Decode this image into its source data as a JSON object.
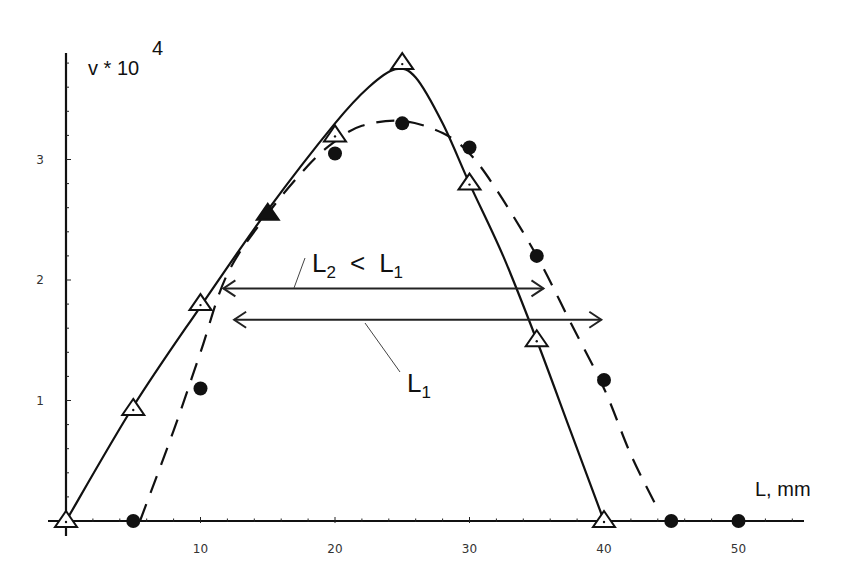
{
  "chart_data": {
    "type": "line",
    "title": "",
    "xlabel": "L, mm",
    "ylabel": "v * 10^4",
    "ylabel_base": "v * 10",
    "ylabel_exp": "4",
    "xlim": [
      0,
      52
    ],
    "ylim": [
      0,
      3.9
    ],
    "x_ticks": [
      10,
      20,
      30,
      40,
      50
    ],
    "y_ticks": [
      1,
      2,
      3
    ],
    "grid": false,
    "legend": null,
    "series": [
      {
        "name": "triangles (solid line)",
        "marker": "open-triangle",
        "line_style": "solid",
        "points": [
          {
            "x": 0,
            "y": 0
          },
          {
            "x": 5,
            "y": 0.93
          },
          {
            "x": 10,
            "y": 1.8
          },
          {
            "x": 15,
            "y": 2.55
          },
          {
            "x": 20,
            "y": 3.2
          },
          {
            "x": 25,
            "y": 3.8
          },
          {
            "x": 30,
            "y": 2.8
          },
          {
            "x": 35,
            "y": 1.5
          },
          {
            "x": 40,
            "y": 0
          }
        ],
        "curve": [
          [
            0,
            0
          ],
          [
            5,
            0.95
          ],
          [
            10,
            1.78
          ],
          [
            15,
            2.58
          ],
          [
            20,
            3.3
          ],
          [
            22.5,
            3.6
          ],
          [
            24.5,
            3.75
          ],
          [
            26,
            3.68
          ],
          [
            28,
            3.3
          ],
          [
            30,
            2.8
          ],
          [
            32.5,
            2.2
          ],
          [
            35,
            1.5
          ],
          [
            37.5,
            0.75
          ],
          [
            40,
            0
          ]
        ]
      },
      {
        "name": "circles (dashed line)",
        "marker": "filled-circle",
        "line_style": "dashed",
        "points": [
          {
            "x": 5,
            "y": 0
          },
          {
            "x": 10,
            "y": 1.1
          },
          {
            "x": 20,
            "y": 3.05
          },
          {
            "x": 25,
            "y": 3.3
          },
          {
            "x": 30,
            "y": 3.1
          },
          {
            "x": 35,
            "y": 2.2
          },
          {
            "x": 40,
            "y": 1.17
          },
          {
            "x": 45,
            "y": 0
          },
          {
            "x": 50,
            "y": 0
          }
        ],
        "curve": [
          [
            5.5,
            0
          ],
          [
            8,
            0.75
          ],
          [
            10,
            1.4
          ],
          [
            12,
            2.05
          ],
          [
            15,
            2.55
          ],
          [
            18,
            2.95
          ],
          [
            20,
            3.15
          ],
          [
            22,
            3.28
          ],
          [
            25,
            3.32
          ],
          [
            28,
            3.22
          ],
          [
            30,
            3.05
          ],
          [
            32,
            2.75
          ],
          [
            35,
            2.2
          ],
          [
            37.5,
            1.65
          ],
          [
            40,
            1.1
          ],
          [
            42,
            0.55
          ],
          [
            44,
            0.1
          ]
        ]
      }
    ],
    "annotations": [
      {
        "id": "L2",
        "type": "double-arrow",
        "x_start": 11.7,
        "x_end": 35.5,
        "y": 1.93,
        "label_main": "L",
        "label_sub": "2",
        "label_rel": "<",
        "label_ref_main": "L",
        "label_ref_sub": "1",
        "text": "L2 < L1"
      },
      {
        "id": "L1",
        "type": "double-arrow",
        "x_start": 12.5,
        "x_end": 39.8,
        "y": 1.67,
        "label_main": "L",
        "label_sub": "1",
        "text": "L1"
      }
    ]
  }
}
